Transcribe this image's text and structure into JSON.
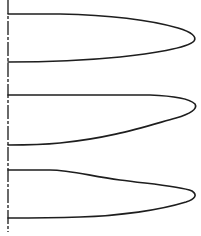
{
  "diagram": {
    "type": "velocity-profile-sketch",
    "colors": {
      "background": "#ffffff",
      "ink": "#1e1e1e"
    },
    "axis": {
      "x": 8,
      "y_start": 0,
      "y_end": 232
    },
    "profiles": [
      {
        "name": "profile-1-symmetric",
        "path": "M8,14 L60,14 C110,15 150,20 178,28 C192,32 197,37 194,41 C188,48 150,54 120,57 C90,60 40,62 8,62"
      },
      {
        "name": "profile-2-flat-top",
        "path": "M8,95 L150,95 C175,96 190,99 195,104 C198,109 190,114 176,118 C140,128 110,138 60,143 C40,145 20,145 8,145"
      },
      {
        "name": "profile-3-skewed",
        "path": "M8,170 L50,170 C70,170 90,176 120,180 C150,184 180,186 192,191 C198,195 195,199 186,202 C160,210 120,216 80,217 C50,218 25,218 8,218"
      }
    ]
  }
}
